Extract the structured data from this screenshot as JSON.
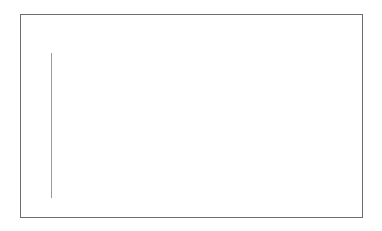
{
  "chart_data": {
    "type": "bar",
    "categories": [
      "Hockey Fight",
      "Violent-Flow"
    ],
    "values": [
      92.25,
      91.53
    ],
    "xlabel": "",
    "ylabel": "",
    "ylim": [
      91,
      92.4
    ],
    "yticks": [
      "91",
      "91.2",
      "91.4",
      "91.6",
      "91.8",
      "92",
      "92.2",
      "92.4"
    ],
    "grid": true,
    "legend": "none",
    "bar_color": "#6b6b6b"
  }
}
